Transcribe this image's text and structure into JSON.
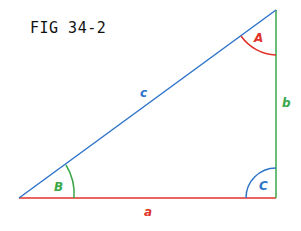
{
  "figure": {
    "title": "FIG 34-2",
    "sides": {
      "a": {
        "label": "a",
        "color": "#e0332a"
      },
      "b": {
        "label": "b",
        "color": "#3aa84a"
      },
      "c": {
        "label": "c",
        "color": "#2f74c9"
      }
    },
    "angles": {
      "A": {
        "label": "A",
        "color": "#e0332a"
      },
      "B": {
        "label": "B",
        "color": "#3aa84a"
      },
      "C": {
        "label": "C",
        "color": "#2f74c9"
      }
    }
  }
}
